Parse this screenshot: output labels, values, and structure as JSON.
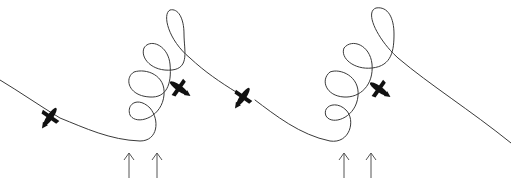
{
  "diagram": {
    "panels": [
      {
        "id": "left",
        "birds": [
          {
            "x": 50,
            "y": 117,
            "angle": -55
          },
          {
            "x": 178,
            "y": 87,
            "angle": 35
          }
        ],
        "arrows": [
          {
            "x": 129
          },
          {
            "x": 157
          }
        ]
      },
      {
        "id": "right",
        "birds": [
          {
            "x": 243,
            "y": 97,
            "angle": -55
          },
          {
            "x": 378,
            "y": 88,
            "angle": 35
          }
        ],
        "arrows": [
          {
            "x": 344
          },
          {
            "x": 371
          }
        ]
      }
    ],
    "colors": {
      "line": "#3a3a3a",
      "bird": "#111111",
      "arrow": "#555555",
      "background": "#ffffff"
    }
  }
}
